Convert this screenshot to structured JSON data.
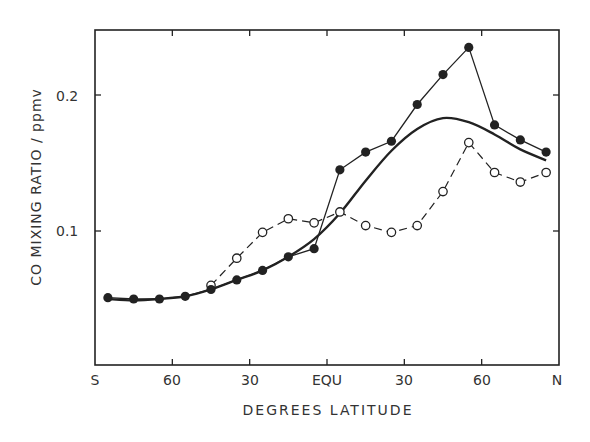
{
  "chart_data": {
    "type": "line",
    "title": "",
    "xlabel": "DEGREES LATITUDE",
    "ylabel": "CO MIXING RATIO / ppmv",
    "xlim": [
      -90,
      90
    ],
    "ylim": [
      0,
      0.25
    ],
    "grid": false,
    "legend": null,
    "x_ticks": [
      {
        "value": -90,
        "label": "S"
      },
      {
        "value": -60,
        "label": "60"
      },
      {
        "value": -30,
        "label": "30"
      },
      {
        "value": 0,
        "label": "EQU"
      },
      {
        "value": 30,
        "label": "30"
      },
      {
        "value": 60,
        "label": "60"
      },
      {
        "value": 90,
        "label": "N"
      }
    ],
    "y_ticks": [
      {
        "value": 0.1,
        "label": "0.1"
      },
      {
        "value": 0.2,
        "label": "0.2"
      }
    ],
    "series": [
      {
        "name": "filled circles (solid line)",
        "style": "solid-line-filled-markers",
        "x": [
          -85,
          -75,
          -65,
          -55,
          -45,
          -35,
          -25,
          -15,
          -5,
          5,
          15,
          25,
          35,
          45,
          55,
          65,
          75,
          85
        ],
        "values": [
          0.051,
          0.05,
          0.05,
          0.052,
          0.057,
          0.064,
          0.071,
          0.081,
          0.087,
          0.145,
          0.158,
          0.166,
          0.193,
          0.215,
          0.235,
          0.178,
          0.167,
          0.158
        ]
      },
      {
        "name": "open circles (dashed line)",
        "style": "dashed-line-open-markers",
        "x": [
          -45,
          -35,
          -25,
          -15,
          -5,
          5,
          15,
          25,
          35,
          45,
          55,
          65,
          75,
          85
        ],
        "values": [
          0.06,
          0.08,
          0.099,
          0.109,
          0.106,
          0.114,
          0.104,
          0.099,
          0.104,
          0.129,
          0.165,
          0.143,
          0.136,
          0.143
        ]
      },
      {
        "name": "smooth model curve (thick line)",
        "style": "thick-smooth-line",
        "x": [
          -85,
          -75,
          -65,
          -55,
          -45,
          -35,
          -25,
          -15,
          -5,
          5,
          15,
          25,
          35,
          45,
          55,
          65,
          75,
          85
        ],
        "values": [
          0.05,
          0.049,
          0.05,
          0.052,
          0.057,
          0.064,
          0.071,
          0.081,
          0.094,
          0.113,
          0.137,
          0.159,
          0.175,
          0.183,
          0.18,
          0.171,
          0.16,
          0.152
        ]
      }
    ]
  },
  "labels": {
    "ylabel": "CO MIXING RATIO / ppmv",
    "xlabel": "DEGREES LATITUDE",
    "xticks": [
      "S",
      "60",
      "30",
      "EQU",
      "30",
      "60",
      "N"
    ],
    "yticks": [
      "0.1",
      "0.2"
    ]
  },
  "colors": {
    "ink": "#222222",
    "background": "#ffffff"
  }
}
